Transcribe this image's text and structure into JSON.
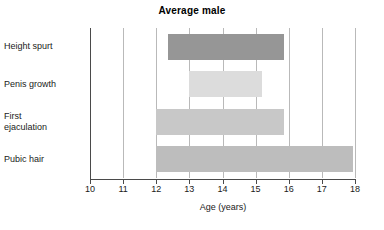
{
  "chart_data": {
    "type": "bar",
    "orientation": "horizontal",
    "title": "Average male",
    "xlabel": "Age (years)",
    "ylabel": "",
    "xlim": [
      10,
      18
    ],
    "xticks": [
      10,
      11,
      12,
      13,
      14,
      15,
      16,
      17,
      18
    ],
    "xticklabels": [
      "10",
      "11",
      "12",
      "13",
      "14",
      "15",
      "16",
      "17",
      "18"
    ],
    "grid": true,
    "grid_axis": "x",
    "legend": false,
    "categories": [
      "Height spurt",
      "Penis growth",
      "First ejaculation",
      "Pubic hair"
    ],
    "bars": [
      {
        "label": "Height spurt",
        "label_lines": [
          "Height spurt"
        ],
        "start": 12.35,
        "end": 15.85,
        "color": "#969696"
      },
      {
        "label": "Penis growth",
        "label_lines": [
          "Penis growth"
        ],
        "start": 13.0,
        "end": 15.2,
        "color": "#dcdcdc"
      },
      {
        "label": "First ejaculation",
        "label_lines": [
          "First",
          "ejaculation"
        ],
        "start": 12.0,
        "end": 15.85,
        "color": "#c8c8c8"
      },
      {
        "label": "Pubic hair",
        "label_lines": [
          "Pubic hair"
        ],
        "start": 12.0,
        "end": 17.95,
        "color": "#bdbdbd"
      }
    ],
    "colors": {
      "axis": "#4a4a4a",
      "grid": "#b9b9b9",
      "text": "#1a1a1a",
      "background": "#ffffff"
    }
  }
}
